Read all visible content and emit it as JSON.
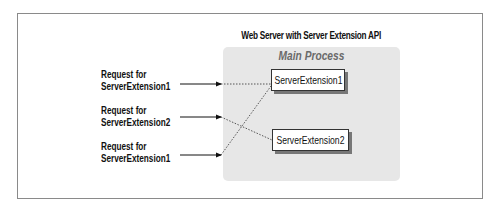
{
  "diagram": {
    "title": "Web Server with Server Extension API",
    "process": {
      "label": "Main Process",
      "background_color": "#e7e7e7"
    },
    "extensions": [
      {
        "label": "ServerExtension1"
      },
      {
        "label": "ServerExtension2"
      }
    ],
    "requests": [
      {
        "line1": "Request for",
        "line2": "ServerExtension1",
        "target": "ServerExtension1"
      },
      {
        "line1": "Request for",
        "line2": "ServerExtension2",
        "target": "ServerExtension2"
      },
      {
        "line1": "Request for",
        "line2": "ServerExtension1",
        "target": "ServerExtension1"
      }
    ],
    "edges": [
      {
        "from": "request-1",
        "to": "ServerExtension1",
        "style": "dotted"
      },
      {
        "from": "request-2",
        "to": "ServerExtension2",
        "style": "dotted"
      },
      {
        "from": "request-3",
        "to": "ServerExtension1",
        "style": "dotted"
      }
    ]
  }
}
